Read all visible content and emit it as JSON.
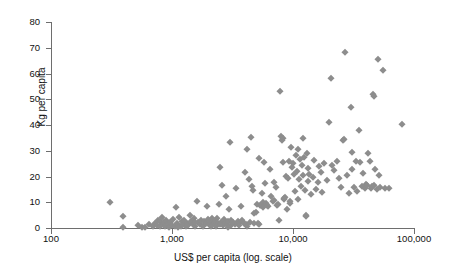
{
  "chart_data": {
    "type": "scatter",
    "title": "",
    "xlabel": "US$ per capita (log. scale)",
    "ylabel": "Kg per capita",
    "xscale": "log",
    "yscale": "linear",
    "xlim": [
      100,
      100000
    ],
    "ylim": [
      0,
      80
    ],
    "x_ticks": [
      100,
      1000,
      10000,
      100000
    ],
    "x_tick_labels": [
      "100",
      "1,000",
      "10,000",
      "100,000"
    ],
    "y_ticks": [
      0,
      10,
      20,
      30,
      40,
      50,
      60,
      70,
      80
    ],
    "y_tick_labels": [
      "0",
      "10",
      "20",
      "30",
      "40",
      "50",
      "60",
      "70",
      "80"
    ],
    "grid": false,
    "legend": false,
    "marker": "diamond",
    "marker_color": "#8d8d8d",
    "n_points": 203,
    "points": [
      [
        310,
        10.2
      ],
      [
        390,
        4.8
      ],
      [
        395,
        0.5
      ],
      [
        520,
        1.2
      ],
      [
        560,
        0.4
      ],
      [
        600,
        0.3
      ],
      [
        640,
        1.6
      ],
      [
        700,
        0.6
      ],
      [
        720,
        2.0
      ],
      [
        750,
        1.1
      ],
      [
        770,
        3.2
      ],
      [
        790,
        2.6
      ],
      [
        800,
        0.9
      ],
      [
        820,
        4.1
      ],
      [
        840,
        1.4
      ],
      [
        860,
        2.2
      ],
      [
        880,
        0.7
      ],
      [
        900,
        3.0
      ],
      [
        920,
        1.8
      ],
      [
        950,
        0.5
      ],
      [
        970,
        2.4
      ],
      [
        1000,
        1.0
      ],
      [
        1020,
        3.6
      ],
      [
        1050,
        0.8
      ],
      [
        1080,
        8.1
      ],
      [
        1100,
        2.1
      ],
      [
        1130,
        1.3
      ],
      [
        1150,
        4.4
      ],
      [
        1180,
        0.6
      ],
      [
        1200,
        2.8
      ],
      [
        1230,
        1.5
      ],
      [
        1260,
        3.3
      ],
      [
        1300,
        0.9
      ],
      [
        1330,
        2.0
      ],
      [
        1360,
        1.1
      ],
      [
        1400,
        5.2
      ],
      [
        1440,
        2.6
      ],
      [
        1480,
        1.7
      ],
      [
        1520,
        3.9
      ],
      [
        1560,
        0.8
      ],
      [
        1600,
        10.6
      ],
      [
        1650,
        2.3
      ],
      [
        1700,
        1.4
      ],
      [
        1750,
        3.1
      ],
      [
        1800,
        0.7
      ],
      [
        1850,
        2.7
      ],
      [
        1900,
        1.9
      ],
      [
        1950,
        8.4
      ],
      [
        2000,
        3.4
      ],
      [
        2050,
        1.2
      ],
      [
        2100,
        2.5
      ],
      [
        2150,
        4.0
      ],
      [
        2200,
        1.6
      ],
      [
        2250,
        2.9
      ],
      [
        2300,
        0.9
      ],
      [
        2350,
        3.7
      ],
      [
        2400,
        1.8
      ],
      [
        2450,
        9.2
      ],
      [
        2500,
        23.5
      ],
      [
        2550,
        2.2
      ],
      [
        2600,
        16.7
      ],
      [
        2650,
        1.3
      ],
      [
        2700,
        3.5
      ],
      [
        2750,
        2.0
      ],
      [
        2800,
        12.3
      ],
      [
        2850,
        1.5
      ],
      [
        2900,
        2.8
      ],
      [
        2950,
        7.3
      ],
      [
        3000,
        33.4
      ],
      [
        3050,
        1.1
      ],
      [
        3100,
        3.0
      ],
      [
        3200,
        2.4
      ],
      [
        3300,
        1.7
      ],
      [
        3400,
        15.5
      ],
      [
        3500,
        2.6
      ],
      [
        3600,
        1.9
      ],
      [
        3700,
        8.6
      ],
      [
        3800,
        3.2
      ],
      [
        3900,
        2.1
      ],
      [
        4000,
        21.8
      ],
      [
        4100,
        1.4
      ],
      [
        4200,
        30.5
      ],
      [
        4300,
        19.2
      ],
      [
        4400,
        2.5
      ],
      [
        4500,
        35.3
      ],
      [
        4600,
        16.2
      ],
      [
        4700,
        14.8
      ],
      [
        4800,
        5.9
      ],
      [
        4900,
        6.3
      ],
      [
        5000,
        9.5
      ],
      [
        5100,
        1.8
      ],
      [
        5200,
        27.2
      ],
      [
        5300,
        8.8
      ],
      [
        5400,
        9.1
      ],
      [
        5500,
        13.6
      ],
      [
        5600,
        10.1
      ],
      [
        5700,
        8.2
      ],
      [
        5800,
        25.8
      ],
      [
        5900,
        17.4
      ],
      [
        6000,
        9.8
      ],
      [
        6200,
        8.5
      ],
      [
        6400,
        22.9
      ],
      [
        6600,
        12.6
      ],
      [
        6800,
        10.4
      ],
      [
        7000,
        18.0
      ],
      [
        7200,
        15.9
      ],
      [
        7400,
        9.0
      ],
      [
        7600,
        3.2
      ],
      [
        7800,
        53.2
      ],
      [
        8000,
        35.6
      ],
      [
        8100,
        34.2
      ],
      [
        8200,
        34.9
      ],
      [
        8300,
        25.6
      ],
      [
        8400,
        11.8
      ],
      [
        8500,
        11.2
      ],
      [
        8700,
        20.2
      ],
      [
        8900,
        7.4
      ],
      [
        9100,
        19.6
      ],
      [
        9300,
        26.0
      ],
      [
        9500,
        9.7
      ],
      [
        9700,
        31.4
      ],
      [
        9900,
        23.8
      ],
      [
        10000,
        25.2
      ],
      [
        10200,
        20.8
      ],
      [
        10400,
        14.3
      ],
      [
        10600,
        28.4
      ],
      [
        10800,
        22.0
      ],
      [
        11000,
        30.8
      ],
      [
        11200,
        19.0
      ],
      [
        11400,
        26.8
      ],
      [
        11600,
        16.5
      ],
      [
        11800,
        24.4
      ],
      [
        12000,
        20.5
      ],
      [
        12200,
        34.8
      ],
      [
        12400,
        27.6
      ],
      [
        12600,
        14.6
      ],
      [
        12800,
        4.6
      ],
      [
        13000,
        29.2
      ],
      [
        13200,
        18.4
      ],
      [
        13400,
        23.2
      ],
      [
        13600,
        21.0
      ],
      [
        14000,
        13.2
      ],
      [
        14500,
        20.0
      ],
      [
        15000,
        26.4
      ],
      [
        15500,
        15.1
      ],
      [
        16000,
        17.8
      ],
      [
        16500,
        24.0
      ],
      [
        17000,
        21.6
      ],
      [
        17500,
        14.0
      ],
      [
        18000,
        25.4
      ],
      [
        19000,
        18.8
      ],
      [
        20000,
        41.0
      ],
      [
        20500,
        58.4
      ],
      [
        21000,
        24.6
      ],
      [
        22000,
        22.4
      ],
      [
        23000,
        26.2
      ],
      [
        24000,
        19.4
      ],
      [
        25000,
        15.8
      ],
      [
        26000,
        34.0
      ],
      [
        26500,
        34.6
      ],
      [
        27000,
        68.2
      ],
      [
        28000,
        20.6
      ],
      [
        29000,
        13.6
      ],
      [
        30000,
        47.0
      ],
      [
        30500,
        29.6
      ],
      [
        31000,
        22.8
      ],
      [
        32000,
        16.0
      ],
      [
        33000,
        26.0
      ],
      [
        34000,
        14.2
      ],
      [
        35000,
        38.0
      ],
      [
        36000,
        25.8
      ],
      [
        37000,
        16.4
      ],
      [
        38000,
        21.4
      ],
      [
        39000,
        15.4
      ],
      [
        40000,
        17.0
      ],
      [
        41000,
        16.8
      ],
      [
        42000,
        29.0
      ],
      [
        43000,
        26.2
      ],
      [
        44000,
        15.6
      ],
      [
        45000,
        16.2
      ],
      [
        46000,
        52.0
      ],
      [
        46500,
        51.4
      ],
      [
        47000,
        16.6
      ],
      [
        48000,
        23.0
      ],
      [
        49000,
        15.2
      ],
      [
        50000,
        65.6
      ],
      [
        51000,
        20.4
      ],
      [
        52000,
        16.0
      ],
      [
        55000,
        61.4
      ],
      [
        58000,
        15.4
      ],
      [
        62000,
        15.6
      ],
      [
        80000,
        40.4
      ],
      [
        1120,
        0.4
      ],
      [
        1340,
        1.0
      ],
      [
        1560,
        2.3
      ],
      [
        2120,
        0.8
      ],
      [
        2480,
        1.6
      ],
      [
        2880,
        0.5
      ],
      [
        3150,
        2.2
      ],
      [
        3550,
        1.2
      ],
      [
        4150,
        0.9
      ],
      [
        4750,
        2.0
      ],
      [
        5250,
        1.4
      ],
      [
        6100,
        8.9
      ],
      [
        6900,
        10.8
      ],
      [
        7500,
        9.3
      ],
      [
        8600,
        12.0
      ],
      [
        9400,
        10.6
      ],
      [
        11100,
        11.4
      ],
      [
        12900,
        5.2
      ]
    ]
  },
  "axes": {
    "y_title": "Kg per capita",
    "x_title": "US$ per capita (log. scale)"
  }
}
